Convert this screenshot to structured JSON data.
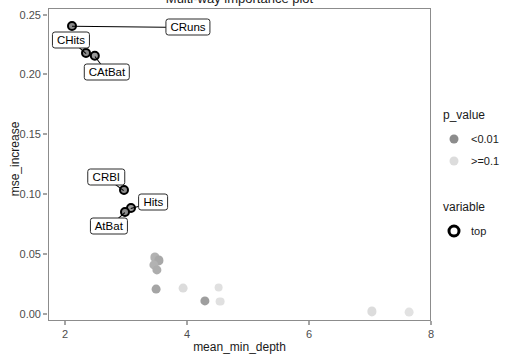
{
  "chart_data": {
    "type": "scatter",
    "title": "Multi-way importance plot",
    "xlabel": "mean_min_depth",
    "ylabel": "mse_increase",
    "xlim": [
      1.72,
      8.0
    ],
    "ylim": [
      -0.006,
      0.2555
    ],
    "xticks": [
      2,
      4,
      6,
      8
    ],
    "xtick_labels": [
      "2",
      "4",
      "6",
      "8"
    ],
    "yticks": [
      0.0,
      0.05,
      0.1,
      0.15,
      0.2,
      0.25
    ],
    "ytick_labels": [
      "0.00",
      "0.05",
      "0.10",
      "0.15",
      "0.20",
      "0.25"
    ],
    "grid": false,
    "legend_position": "right",
    "colors": {
      "p_low": "#8c8c8c",
      "p_high": "#dcdcdc",
      "top_ring": "#000000",
      "panel_border": "#8c8c8c",
      "axis_text": "#4d4d4d"
    },
    "points": [
      {
        "label": "CRuns",
        "x": 2.1,
        "y": 0.2415,
        "p_value": "<0.01",
        "top": true,
        "r": 5.0,
        "fill": "#8c8c8c"
      },
      {
        "label": "CHits",
        "x": 2.33,
        "y": 0.219,
        "p_value": "<0.01",
        "top": true,
        "r": 5.0,
        "fill": "#8c8c8c"
      },
      {
        "label": "CAtBat",
        "x": 2.47,
        "y": 0.2165,
        "p_value": "<0.01",
        "top": true,
        "r": 5.2,
        "fill": "#9a9a9a"
      },
      {
        "label": "CRBI",
        "x": 2.95,
        "y": 0.104,
        "p_value": "<0.01",
        "top": true,
        "r": 5.0,
        "fill": "#8c8c8c"
      },
      {
        "label": "Hits",
        "x": 3.06,
        "y": 0.089,
        "p_value": "<0.01",
        "top": true,
        "r": 5.0,
        "fill": "#9a9a9a"
      },
      {
        "label": "AtBat",
        "x": 2.96,
        "y": 0.0855,
        "p_value": "<0.01",
        "top": true,
        "r": 5.0,
        "fill": "#8c8c8c"
      },
      {
        "label": "",
        "x": 3.46,
        "y": 0.048,
        "p_value": "<0.01",
        "top": false,
        "r": 4.6,
        "fill": "#b2b2b2"
      },
      {
        "label": "",
        "x": 3.52,
        "y": 0.0455,
        "p_value": "<0.01",
        "top": false,
        "r": 4.6,
        "fill": "#a8a8a8"
      },
      {
        "label": "",
        "x": 3.44,
        "y": 0.0415,
        "p_value": "<0.01",
        "top": false,
        "r": 4.6,
        "fill": "#b2b2b2"
      },
      {
        "label": "",
        "x": 3.49,
        "y": 0.0375,
        "p_value": "<0.01",
        "top": false,
        "r": 4.6,
        "fill": "#adadad"
      },
      {
        "label": "",
        "x": 3.48,
        "y": 0.0215,
        "p_value": "<0.01",
        "top": false,
        "r": 4.4,
        "fill": "#a5a5a5"
      },
      {
        "label": "",
        "x": 3.92,
        "y": 0.0225,
        "p_value": ">=0.1",
        "top": false,
        "r": 4.4,
        "fill": "#dcdcdc"
      },
      {
        "label": "",
        "x": 4.28,
        "y": 0.0118,
        "p_value": "<0.01",
        "top": false,
        "r": 4.6,
        "fill": "#9e9e9e"
      },
      {
        "label": "",
        "x": 4.5,
        "y": 0.0228,
        "p_value": ">=0.1",
        "top": false,
        "r": 4.4,
        "fill": "#e0e0e0"
      },
      {
        "label": "",
        "x": 4.52,
        "y": 0.011,
        "p_value": ">=0.1",
        "top": false,
        "r": 4.4,
        "fill": "#e0e0e0"
      },
      {
        "label": "",
        "x": 7.02,
        "y": 0.0028,
        "p_value": ">=0.1",
        "top": false,
        "r": 4.6,
        "fill": "#dcdcdc"
      },
      {
        "label": "",
        "x": 7.62,
        "y": 0.0022,
        "p_value": ">=0.1",
        "top": false,
        "r": 4.4,
        "fill": "#e2e2e2"
      }
    ],
    "annotations": [
      {
        "text": "CRuns",
        "lx": 4.0,
        "ly": 0.2405,
        "px": 2.1,
        "py": 0.2415
      },
      {
        "text": "CHits",
        "lx": 2.08,
        "ly": 0.23,
        "px": 2.33,
        "py": 0.219
      },
      {
        "text": "CAtBat",
        "lx": 2.67,
        "ly": 0.203,
        "px": 2.47,
        "py": 0.2165
      },
      {
        "text": "CRBI",
        "lx": 2.66,
        "ly": 0.115,
        "px": 2.95,
        "py": 0.104
      },
      {
        "text": "Hits",
        "lx": 3.43,
        "ly": 0.094,
        "px": 3.06,
        "py": 0.089
      },
      {
        "text": "AtBat",
        "lx": 2.7,
        "ly": 0.074,
        "px": 2.96,
        "py": 0.0855
      }
    ]
  },
  "legend": {
    "groups": [
      {
        "title": "p_value",
        "entries": [
          {
            "label": "<0.01",
            "swatch": "filled-circle",
            "color": "#8c8c8c"
          },
          {
            "label": ">=0.1",
            "swatch": "filled-circle",
            "color": "#dcdcdc"
          }
        ]
      },
      {
        "title": "variable",
        "entries": [
          {
            "label": "top",
            "swatch": "ring-circle",
            "color": "#000000"
          }
        ]
      }
    ]
  }
}
